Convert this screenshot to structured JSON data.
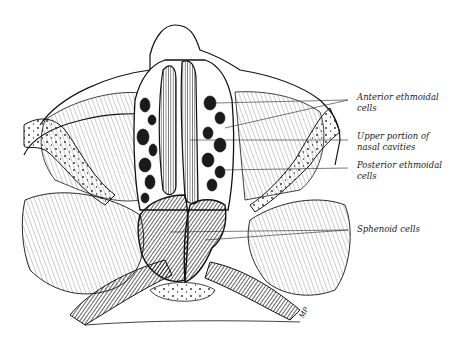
{
  "figure": {
    "colors": {
      "ink": "#111111",
      "paper": "#ffffff",
      "shade": "#2a2a2a"
    }
  },
  "labels": [
    {
      "id": "anterior-ethmoidal",
      "line1": "Anterior ethmoidal",
      "line2": "cells"
    },
    {
      "id": "upper-nasal",
      "line1": "Upper portion of",
      "line2": "nasal cavities"
    },
    {
      "id": "posterior-ethmoidal",
      "line1": "Posterior ethmoidal",
      "line2": "cells"
    },
    {
      "id": "sphenoid",
      "line1": "Sphenoid cells"
    }
  ],
  "signature": "MP"
}
